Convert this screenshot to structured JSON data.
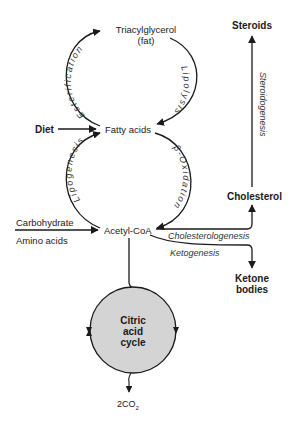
{
  "diagram": {
    "type": "metabolic-pathway",
    "nodes": {
      "triacylglycerol": "Triacylglycerol",
      "triacylglycerol_sub": "(fat)",
      "fatty_acids": "Fatty acids",
      "acetyl_coa": "Acetyl-CoA",
      "diet": "Diet",
      "carbohydrate": "Carbohydrate",
      "amino_acids": "Amino acids",
      "steroids": "Steroids",
      "cholesterol": "Cholesterol",
      "ketone_bodies_1": "Ketone",
      "ketone_bodies_2": "bodies",
      "citric_1": "Citric",
      "citric_2": "acid",
      "citric_3": "cycle",
      "co2_prefix": "2CO",
      "co2_sub": "2"
    },
    "processes": {
      "esterification": "Esterification",
      "lipolysis": "Lipolysis",
      "lipogenesis": "Lipogenesis",
      "beta_oxidation": "β-Oxidation",
      "steroidogenesis": "Steroidogenesis",
      "cholesterologenesis": "Cholesterologenesis",
      "ketogenesis": "Ketogenesis"
    },
    "colors": {
      "line": "#1a1a1a",
      "cycle_fill": "#d4d4d4"
    }
  }
}
